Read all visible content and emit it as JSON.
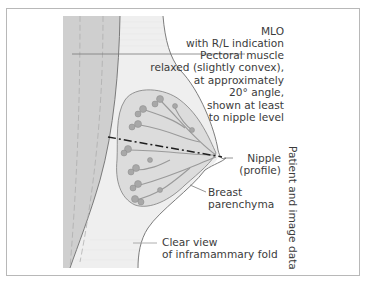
{
  "figure": {
    "type": "mammography positioning diagram",
    "colors": {
      "frame": "#b8b8b8",
      "pectoral_band": "#cfcfcf",
      "background_tissue": "#efefef",
      "parenchyma": "#dcdcdc",
      "ducts": "#9a9a9a",
      "outline": "#6e6e6e",
      "text": "#3b3b3b"
    }
  },
  "labels": {
    "view": {
      "line1": "MLO",
      "line2": "with R/L indication"
    },
    "pectoral": {
      "line1": "Pectoral muscle",
      "line2": "relaxed (slightly convex),",
      "line3": "at approximately",
      "line4": "20° angle,",
      "line5": "shown at least",
      "line6": "to nipple level"
    },
    "nipple": {
      "line1": "Nipple",
      "line2": "(profile)"
    },
    "parenchyma": {
      "line1": "Breast",
      "line2": "parenchyma"
    },
    "fold": {
      "line1": "Clear view",
      "line2": "of inframammary fold"
    },
    "side": "Patient and image data"
  }
}
